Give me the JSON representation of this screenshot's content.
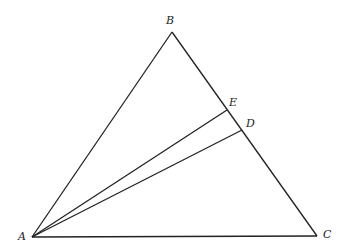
{
  "diagram": {
    "type": "geometry-triangle",
    "points": {
      "A": {
        "label": "A",
        "x": 32,
        "y": 237
      },
      "B": {
        "label": "B",
        "x": 172,
        "y": 32
      },
      "C": {
        "label": "C",
        "x": 317,
        "y": 236
      },
      "D": {
        "label": "D",
        "x": 242,
        "y": 130
      },
      "E": {
        "label": "E",
        "x": 227,
        "y": 110
      }
    },
    "segments": [
      [
        "A",
        "B"
      ],
      [
        "B",
        "C"
      ],
      [
        "A",
        "C"
      ],
      [
        "A",
        "D"
      ],
      [
        "A",
        "E"
      ]
    ],
    "labels": [
      {
        "text": "A",
        "x": 18,
        "y": 240
      },
      {
        "text": "B",
        "x": 166,
        "y": 24
      },
      {
        "text": "C",
        "x": 323,
        "y": 238
      },
      {
        "text": "D",
        "x": 246,
        "y": 127
      },
      {
        "text": "E",
        "x": 229,
        "y": 106
      }
    ]
  }
}
